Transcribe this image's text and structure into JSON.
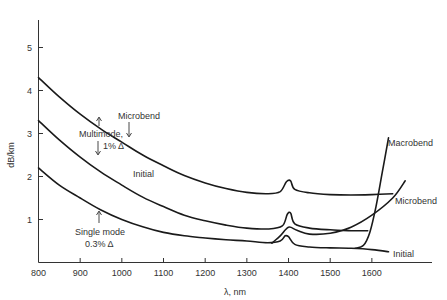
{
  "chart_data": {
    "type": "line",
    "title": "",
    "xlabel": "λ, nm",
    "ylabel": "dB/km",
    "xlim": [
      800,
      1700
    ],
    "ylim": [
      0,
      5.5
    ],
    "x_ticks": [
      "800",
      "900",
      "1000",
      "1100",
      "1200",
      "1300",
      "1400",
      "1500",
      "1600"
    ],
    "y_ticks": [
      "1",
      "2",
      "3",
      "4",
      "5"
    ],
    "grid": false,
    "series": [
      {
        "name": "Multimode 1% Δ — Microbend",
        "points": [
          [
            800,
            4.3
          ],
          [
            850,
            3.85
          ],
          [
            900,
            3.45
          ],
          [
            950,
            3.1
          ],
          [
            1000,
            2.8
          ],
          [
            1050,
            2.5
          ],
          [
            1100,
            2.25
          ],
          [
            1150,
            2.02
          ],
          [
            1200,
            1.85
          ],
          [
            1250,
            1.72
          ],
          [
            1300,
            1.63
          ],
          [
            1350,
            1.6
          ],
          [
            1380,
            1.65
          ],
          [
            1395,
            1.88
          ],
          [
            1405,
            1.9
          ],
          [
            1415,
            1.7
          ],
          [
            1450,
            1.62
          ],
          [
            1500,
            1.58
          ],
          [
            1550,
            1.57
          ],
          [
            1600,
            1.58
          ],
          [
            1650,
            1.6
          ]
        ]
      },
      {
        "name": "Multimode 1% Δ — Initial",
        "points": [
          [
            800,
            3.3
          ],
          [
            850,
            2.85
          ],
          [
            900,
            2.45
          ],
          [
            950,
            2.1
          ],
          [
            1000,
            1.8
          ],
          [
            1050,
            1.52
          ],
          [
            1100,
            1.3
          ],
          [
            1150,
            1.1
          ],
          [
            1200,
            0.97
          ],
          [
            1250,
            0.87
          ],
          [
            1300,
            0.8
          ],
          [
            1350,
            0.78
          ],
          [
            1385,
            0.85
          ],
          [
            1397,
            1.12
          ],
          [
            1405,
            1.15
          ],
          [
            1415,
            0.9
          ],
          [
            1450,
            0.8
          ],
          [
            1500,
            0.76
          ],
          [
            1550,
            0.74
          ],
          [
            1590,
            0.74
          ]
        ]
      },
      {
        "name": "Single mode 0.3% Δ — Initial",
        "points": [
          [
            800,
            2.2
          ],
          [
            850,
            1.8
          ],
          [
            900,
            1.5
          ],
          [
            950,
            1.22
          ],
          [
            1000,
            1.0
          ],
          [
            1050,
            0.83
          ],
          [
            1100,
            0.7
          ],
          [
            1150,
            0.62
          ],
          [
            1200,
            0.57
          ],
          [
            1250,
            0.53
          ],
          [
            1300,
            0.5
          ],
          [
            1350,
            0.46
          ],
          [
            1380,
            0.5
          ],
          [
            1392,
            0.62
          ],
          [
            1400,
            0.6
          ],
          [
            1415,
            0.42
          ],
          [
            1450,
            0.36
          ],
          [
            1500,
            0.34
          ],
          [
            1550,
            0.33
          ],
          [
            1600,
            0.3
          ],
          [
            1640,
            0.25
          ]
        ]
      },
      {
        "name": "Single mode 0.3% Δ — Microbend",
        "points": [
          [
            1360,
            0.45
          ],
          [
            1380,
            0.62
          ],
          [
            1400,
            0.82
          ],
          [
            1420,
            0.75
          ],
          [
            1450,
            0.66
          ],
          [
            1500,
            0.68
          ],
          [
            1550,
            0.82
          ],
          [
            1600,
            1.1
          ],
          [
            1650,
            1.5
          ],
          [
            1680,
            1.9
          ]
        ]
      },
      {
        "name": "Single mode 0.3% Δ — Macrobend",
        "points": [
          [
            1560,
            0.33
          ],
          [
            1580,
            0.4
          ],
          [
            1595,
            0.7
          ],
          [
            1610,
            1.3
          ],
          [
            1625,
            2.1
          ],
          [
            1640,
            2.9
          ]
        ]
      }
    ],
    "annotations": [
      {
        "text": "Microbend",
        "target": "Multimode microbend curve"
      },
      {
        "text": "Multimode,",
        "line2": "1% Δ"
      },
      {
        "text": "Initial",
        "target": "Multimode initial curve"
      },
      {
        "text": "Single mode",
        "line2": "0.3% Δ"
      },
      {
        "text": "Macrobend",
        "target": "Single mode macrobend curve"
      },
      {
        "text": "Microbend",
        "target": "Single mode microbend curve"
      },
      {
        "text": "Initial",
        "target": "Single mode initial curve"
      }
    ]
  },
  "labels": {
    "ylabel": "dB/km",
    "xlabel": "λ, nm",
    "mm_microbend": "Microbend",
    "mm_line1": "Multimode,",
    "mm_line2": "1% Δ",
    "mm_initial": "Initial",
    "sm_line1": "Single mode",
    "sm_line2": "0.3% Δ",
    "sm_macrobend": "Macrobend",
    "sm_microbend": "Microbend",
    "sm_initial": "Initial"
  }
}
